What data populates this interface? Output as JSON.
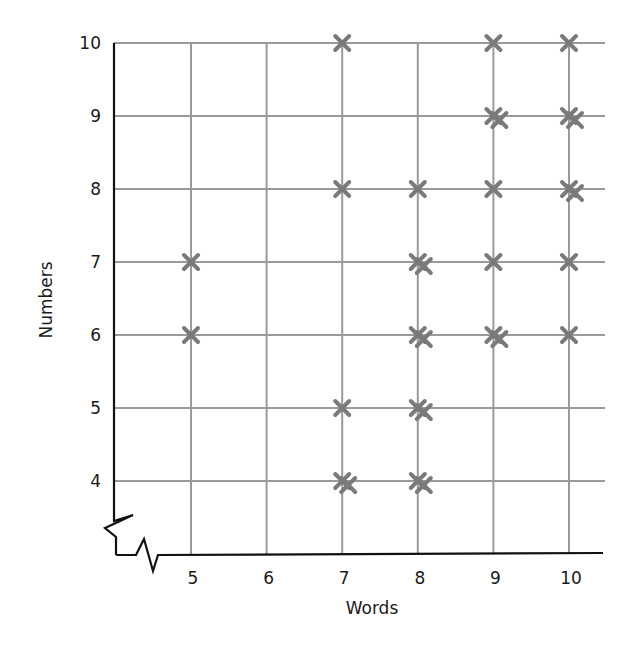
{
  "chart_data": {
    "type": "scatter",
    "title": "",
    "xlabel": "Words",
    "ylabel": "Numbers",
    "xlim": [
      5,
      10
    ],
    "ylim": [
      4,
      10
    ],
    "x_ticks": [
      "5",
      "6",
      "7",
      "8",
      "9",
      "10"
    ],
    "y_ticks": [
      "4",
      "5",
      "6",
      "7",
      "8",
      "9",
      "10"
    ],
    "axis_breaks": {
      "x": true,
      "y": true
    },
    "grid": true,
    "legend": null,
    "marker": "x",
    "marker_color": "#7a7a7a",
    "grid_color": "#9a9a9a",
    "axis_color": "#111111",
    "points": [
      {
        "x": 5,
        "y": 7,
        "count": 1
      },
      {
        "x": 5,
        "y": 6,
        "count": 1
      },
      {
        "x": 7,
        "y": 10,
        "count": 1
      },
      {
        "x": 7,
        "y": 8,
        "count": 1
      },
      {
        "x": 7,
        "y": 5,
        "count": 1
      },
      {
        "x": 7,
        "y": 4,
        "count": 2
      },
      {
        "x": 8,
        "y": 8,
        "count": 1
      },
      {
        "x": 8,
        "y": 7,
        "count": 2
      },
      {
        "x": 8,
        "y": 6,
        "count": 2
      },
      {
        "x": 8,
        "y": 5,
        "count": 2
      },
      {
        "x": 8,
        "y": 4,
        "count": 2
      },
      {
        "x": 9,
        "y": 10,
        "count": 1
      },
      {
        "x": 9,
        "y": 9,
        "count": 2
      },
      {
        "x": 9,
        "y": 8,
        "count": 1
      },
      {
        "x": 9,
        "y": 7,
        "count": 1
      },
      {
        "x": 9,
        "y": 6,
        "count": 2
      },
      {
        "x": 10,
        "y": 10,
        "count": 1
      },
      {
        "x": 10,
        "y": 9,
        "count": 2
      },
      {
        "x": 10,
        "y": 8,
        "count": 2
      },
      {
        "x": 10,
        "y": 7,
        "count": 1
      },
      {
        "x": 10,
        "y": 6,
        "count": 1
      }
    ]
  }
}
